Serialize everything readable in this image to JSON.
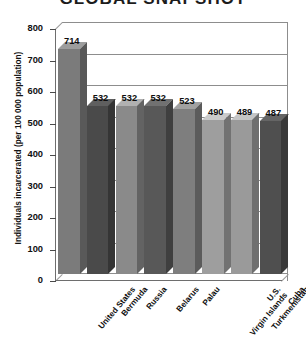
{
  "chart_data": {
    "type": "bar",
    "title": "GLOBAL SNAPSHOT",
    "xlabel": "",
    "ylabel": "Individuals incarcerated (per 100 000 population)",
    "ylim": [
      0,
      800
    ],
    "yticks": [
      "800",
      "700",
      "600",
      "500",
      "400",
      "300",
      "200",
      "100",
      "0"
    ],
    "ytick_values": [
      800,
      700,
      600,
      500,
      400,
      300,
      200,
      100,
      0
    ],
    "grid": true,
    "grid_axis": "y",
    "legend": "none",
    "style": "3d-bar",
    "categories": [
      "United States",
      "Bermuda",
      "Russia",
      "Belarus",
      "Palau",
      "U.S.\nVirgin Islands",
      "Turkmenistan",
      "Cuba"
    ],
    "values": [
      714,
      532,
      532,
      532,
      523,
      490,
      489,
      487
    ],
    "value_labels": [
      "714",
      "532",
      "532",
      "532",
      "523",
      "490",
      "489",
      "487"
    ],
    "bar_colors": [
      "#7b7b7b",
      "#4a4a4a",
      "#8a8a8a",
      "#585858",
      "#7e7e7e",
      "#9e9e9e",
      "#9a9a9a",
      "#4f4f4f"
    ]
  },
  "colors": {
    "background": "#ffffff",
    "axis": "#6e6e6e",
    "grid": "#8d8d8d",
    "text": "#111111"
  }
}
